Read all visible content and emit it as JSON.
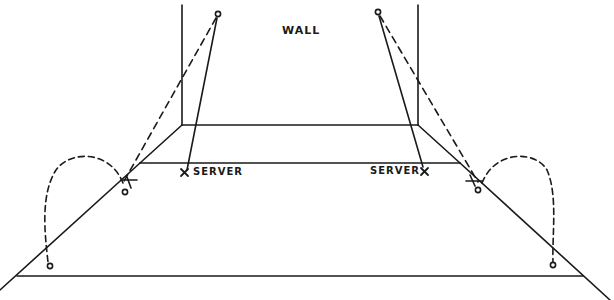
{
  "diagram": {
    "type": "court-diagram",
    "labels": {
      "wall": "WALL",
      "server_left": "SERVER",
      "server_right": "SERVER"
    },
    "markers": {
      "server_symbol": "X",
      "player_symbol": "O"
    },
    "line_color": "#1a1a1a",
    "background": "#ffffff"
  }
}
